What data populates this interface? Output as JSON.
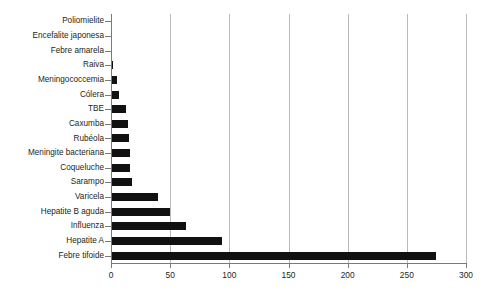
{
  "chart_data": {
    "type": "bar",
    "orientation": "horizontal",
    "title": "",
    "subtitle": "",
    "xlabel": "",
    "ylabel": "",
    "xlim": [
      0,
      300
    ],
    "xticks": [
      0,
      50,
      100,
      150,
      200,
      250,
      300
    ],
    "xtick_labels": [
      "0",
      "50",
      "100",
      "150",
      "200",
      "250",
      "300"
    ],
    "grid": "vertical",
    "legend": "none",
    "bar_color": "#111111",
    "gridline_color": "#b9b9b9",
    "axis_color": "#7a7a7a",
    "categories": [
      "Poliomielite",
      "Encefalite japonesa",
      "Febre amarela",
      "Raiva",
      "Meningococcemia",
      "Cólera",
      "TBE",
      "Caxumba",
      "Rubéola",
      "Meningite bacteriana",
      "Coqueluche",
      "Sarampo",
      "Varicela",
      "Hepatite B aguda",
      "Influenza",
      "Hepatite A",
      "Febre tifoide"
    ],
    "values": [
      1,
      1,
      1,
      2,
      5,
      7,
      13,
      14,
      15,
      16,
      16,
      18,
      40,
      50,
      63,
      94,
      275
    ]
  }
}
